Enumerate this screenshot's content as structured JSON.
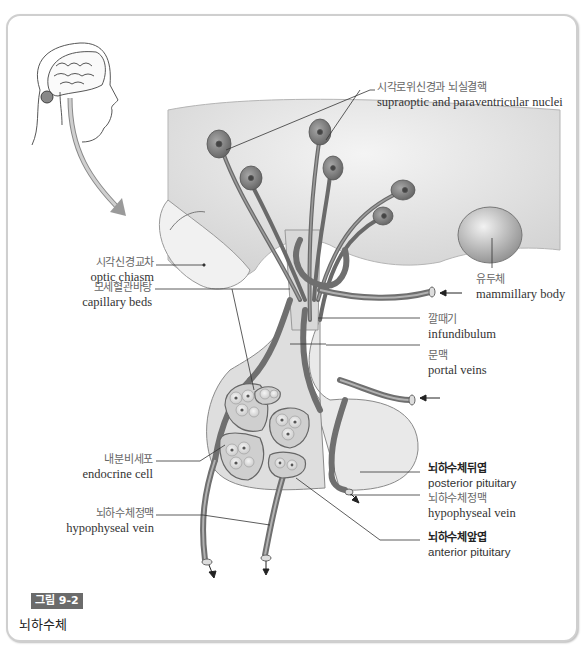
{
  "figure": {
    "badge": "그림 9-2",
    "caption": "뇌하수체"
  },
  "labels": {
    "supraoptic": {
      "ko": "시각로위신경과 뇌실결핵",
      "en": "supraoptic and paraventricular nuclei"
    },
    "optic_chiasm": {
      "ko": "시각신경교차",
      "en": "optic chiasm"
    },
    "mammillary": {
      "ko": "유두체",
      "en": "mammillary body"
    },
    "capillary": {
      "ko": "모세혈관바탕",
      "en": "capillary beds"
    },
    "infundibulum": {
      "ko": "깔때기",
      "en": "infundibulum"
    },
    "portal": {
      "ko": "문맥",
      "en": "portal veins"
    },
    "endocrine": {
      "ko": "내분비세포",
      "en": "endocrine cell"
    },
    "posterior": {
      "ko": "뇌하수체뒤엽",
      "en": "posterior pituitary"
    },
    "hypo_vein_right": {
      "ko": "뇌하수체정맥",
      "en": "hypophyseal vein"
    },
    "hypo_vein_left": {
      "ko": "뇌하수체정맥",
      "en": "hypophyseal vein"
    },
    "anterior": {
      "ko": "뇌하수체앞엽",
      "en": "anterior pituitary"
    }
  },
  "colors": {
    "neuron": "#7a7a7a",
    "vessel": "#8c8c8c",
    "tissue": "#e6e6e6",
    "line": "#333333"
  }
}
